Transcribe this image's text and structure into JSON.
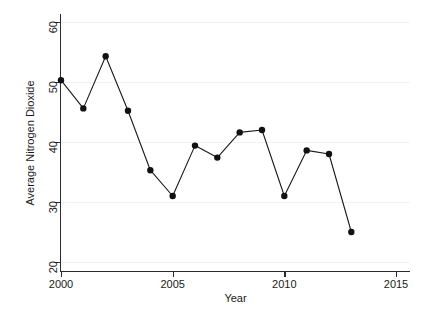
{
  "chart_data": {
    "type": "line",
    "title": "",
    "xlabel": "Year",
    "ylabel": "Average Nitrogen Dioxide",
    "xlim": [
      1999.2,
      2015.6
    ],
    "ylim": [
      19.2,
      61.5
    ],
    "xticks": [
      2000,
      2005,
      2010,
      2015
    ],
    "xticklabels": [
      "2000",
      "2005",
      "2010",
      "2015"
    ],
    "yticks": [
      20,
      30,
      40,
      50,
      60
    ],
    "yticklabels": [
      "20",
      "30",
      "40",
      "50",
      "60"
    ],
    "grid": "horizontal-faint",
    "legend": "none",
    "marker": "filled-circle",
    "line_color": "#1a1a1a",
    "marker_color": "#111111",
    "x": [
      2000,
      2001,
      2002,
      2003,
      2004,
      2005,
      2006,
      2007,
      2008,
      2009,
      2010,
      2011,
      2012,
      2013
    ],
    "values": [
      50.3,
      45.6,
      54.3,
      45.2,
      35.3,
      31.0,
      39.4,
      37.4,
      41.6,
      42.0,
      31.0,
      38.6,
      38.0,
      25.0
    ],
    "points": [
      {
        "x": 2000,
        "y": 50.3
      },
      {
        "x": 2001,
        "y": 45.6
      },
      {
        "x": 2002,
        "y": 54.3
      },
      {
        "x": 2003,
        "y": 45.2
      },
      {
        "x": 2004,
        "y": 35.3
      },
      {
        "x": 2005,
        "y": 31.0
      },
      {
        "x": 2006,
        "y": 39.4
      },
      {
        "x": 2007,
        "y": 37.4
      },
      {
        "x": 2008,
        "y": 41.6
      },
      {
        "x": 2009,
        "y": 42.0
      },
      {
        "x": 2010,
        "y": 31.0
      },
      {
        "x": 2011,
        "y": 38.6
      },
      {
        "x": 2012,
        "y": 38.0
      },
      {
        "x": 2013,
        "y": 25.0
      }
    ]
  },
  "caption": ""
}
